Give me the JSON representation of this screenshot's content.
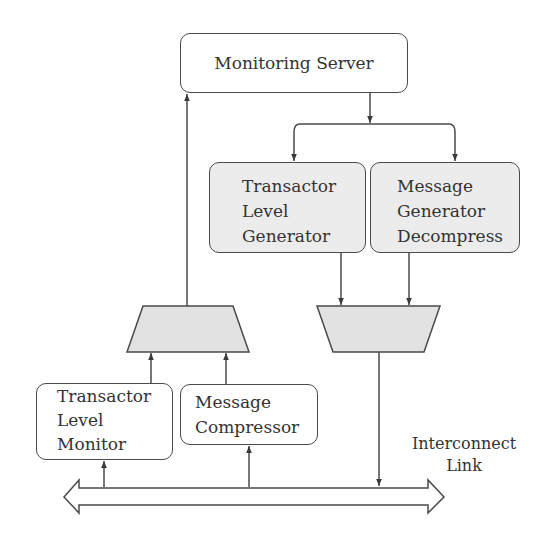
{
  "diagram": {
    "colors": {
      "stroke": "#4a4a4a",
      "box_fill_white": "#ffffff",
      "box_fill_grey": "#ececec",
      "mux_fill": "#e2e2e2",
      "text": "#333333"
    },
    "nodes": {
      "monitoring_server": {
        "lines": [
          "Monitoring Server"
        ]
      },
      "transactor_level_generator": {
        "lines": [
          "Transactor",
          "Level",
          "Generator"
        ]
      },
      "message_generator_decompress": {
        "lines": [
          "Message",
          "Generator",
          "Decompress"
        ]
      },
      "transactor_level_monitor": {
        "lines": [
          "Transactor",
          "Level",
          "Monitor"
        ]
      },
      "message_compressor": {
        "lines": [
          "Message",
          "Compressor"
        ]
      },
      "mux": {
        "shape": "trapezoid"
      },
      "demux": {
        "shape": "inverted-trapezoid"
      }
    },
    "bus": {
      "label_lines": [
        "Interconnect",
        "Link"
      ],
      "shape": "double-headed-arrow"
    },
    "edges": [
      {
        "from": "mux",
        "to": "monitoring_server"
      },
      {
        "from": "monitoring_server",
        "to": "transactor_level_generator"
      },
      {
        "from": "monitoring_server",
        "to": "message_generator_decompress"
      },
      {
        "from": "transactor_level_generator",
        "to": "demux"
      },
      {
        "from": "message_generator_decompress",
        "to": "demux"
      },
      {
        "from": "transactor_level_monitor",
        "to": "mux"
      },
      {
        "from": "message_compressor",
        "to": "mux"
      },
      {
        "from": "bus",
        "to": "transactor_level_monitor"
      },
      {
        "from": "bus",
        "to": "message_compressor"
      },
      {
        "from": "demux",
        "to": "bus"
      }
    ]
  }
}
